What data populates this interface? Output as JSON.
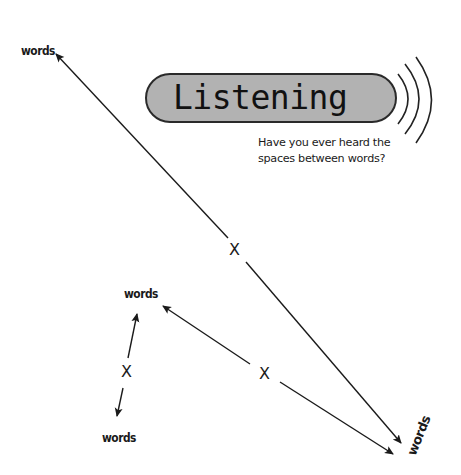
{
  "title": {
    "text": "Listening",
    "fill_color": "#b2b2b2",
    "border_color": "#2a2a2a"
  },
  "caption": {
    "text": "Have you ever heard the spaces between words?"
  },
  "sound_waves": {
    "icon": "sound-waves-icon",
    "count": 3
  },
  "labels": {
    "top_left": "words",
    "middle_left": "words",
    "bottom_left": "words",
    "bottom_right": "words"
  },
  "markers": {
    "center": "X",
    "lower_middle": "X",
    "left": "X"
  },
  "colors": {
    "ink": "#1a1a1a",
    "background": "#ffffff"
  }
}
